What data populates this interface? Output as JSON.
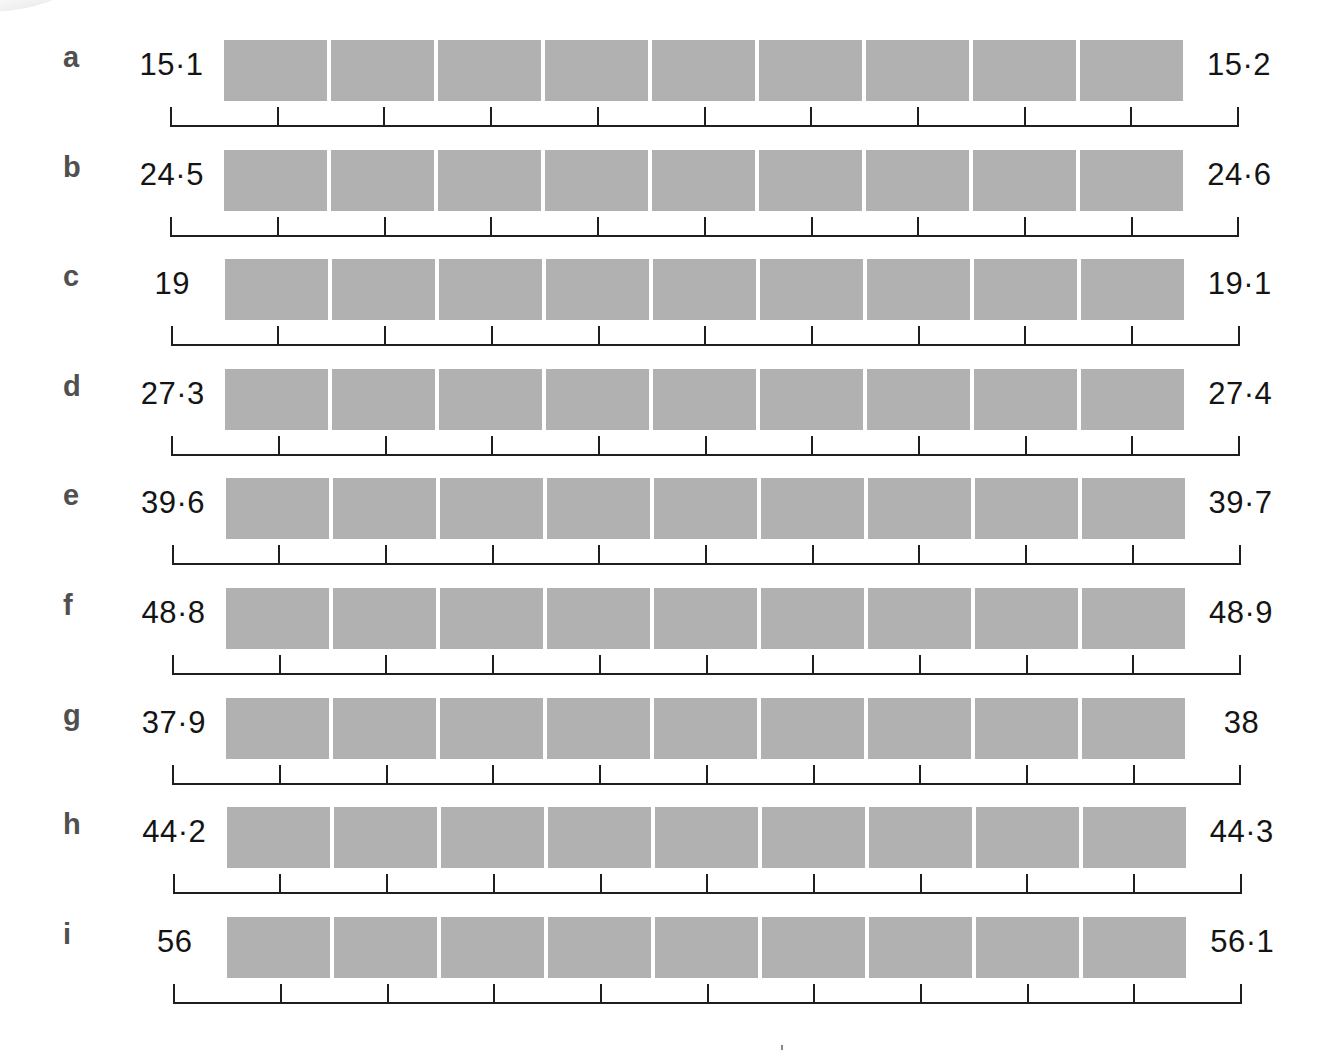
{
  "diagram": {
    "type": "ruler-segments",
    "box_color": "#b1b1b1",
    "line_color": "#1e1e1e",
    "boxes_per_row": 9,
    "ticks_per_row": 11,
    "rows": [
      {
        "letter": "a",
        "start": "15·1",
        "end": "15·2"
      },
      {
        "letter": "b",
        "start": "24·5",
        "end": "24·6"
      },
      {
        "letter": "c",
        "start": "19",
        "end": "19·1"
      },
      {
        "letter": "d",
        "start": "27·3",
        "end": "27·4"
      },
      {
        "letter": "e",
        "start": "39·6",
        "end": "39·7"
      },
      {
        "letter": "f",
        "start": "48·8",
        "end": "48·9"
      },
      {
        "letter": "g",
        "start": "37·9",
        "end": "38"
      },
      {
        "letter": "h",
        "start": "44·2",
        "end": "44·3"
      },
      {
        "letter": "i",
        "start": "56",
        "end": "56·1"
      }
    ]
  }
}
